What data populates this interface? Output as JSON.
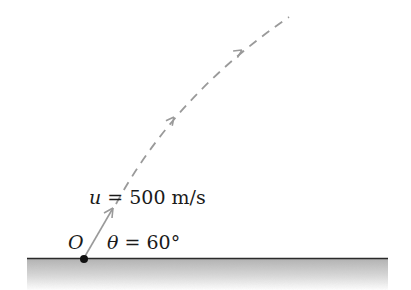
{
  "diagram": {
    "type": "projectile-motion",
    "labels": {
      "origin": "O",
      "velocity_symbol": "u",
      "velocity_eq": " = 500 m/s",
      "angle_symbol": "θ",
      "angle_eq": " = 60°"
    },
    "values": {
      "initial_speed": "500 m/s",
      "launch_angle": "60°"
    },
    "colors": {
      "ground_line": "#2a2a2a",
      "ground_fill_top": "#b5b5b5",
      "ground_fill_bottom": "#ffffff",
      "trajectory": "#9a9a9a",
      "velocity_arrow": "#9a9a9a",
      "origin_dot": "#111111",
      "text": "#1a1a1a"
    }
  }
}
